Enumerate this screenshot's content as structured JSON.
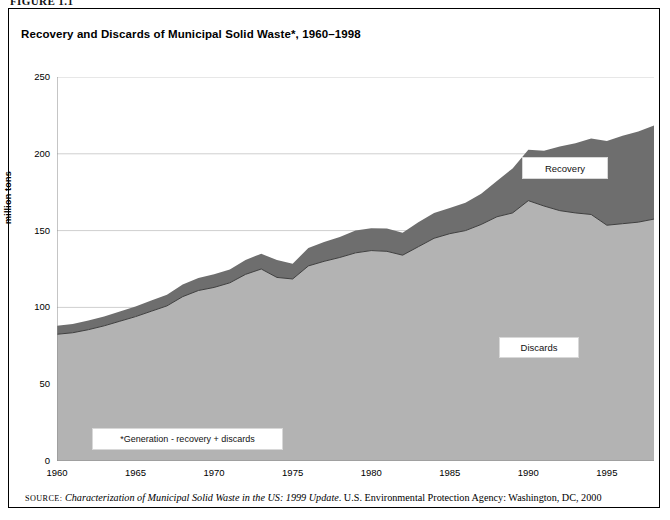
{
  "figure_label": "FIGURE 1.1",
  "chart_title": "Recovery and Discards of Municipal Solid Waste*, 1960–1998",
  "callouts": {
    "recovery": "Recovery",
    "discards": "Discards",
    "footnote": "*Generation - recovery + discards"
  },
  "source": {
    "keyword": "source:",
    "title": "Characterization of Municipal Solid Waste in the US: 1999 Update",
    "rest": ". U.S. Environmental Protection Agency: Washington, DC, 2000"
  },
  "colors": {
    "discards_fill": "#b3b3b3",
    "recovery_fill": "#6e6e6e",
    "axis": "#8c8c8c",
    "gridline": "#cfcfcf",
    "frame": "#000000"
  },
  "chart_data": {
    "type": "area",
    "stacked": true,
    "title": "Recovery and Discards of Municipal Solid Waste*, 1960–1998",
    "xlabel": "",
    "ylabel": "million tons",
    "xlim": [
      1960,
      1998
    ],
    "ylim": [
      0,
      250
    ],
    "yticks": [
      0,
      50,
      100,
      150,
      200,
      250
    ],
    "xticks": [
      1960,
      1965,
      1970,
      1975,
      1980,
      1985,
      1990,
      1995
    ],
    "grid": "horizontal",
    "legend_position": "in-plot-callouts",
    "x": [
      1960,
      1961,
      1962,
      1963,
      1964,
      1965,
      1966,
      1967,
      1968,
      1969,
      1970,
      1971,
      1972,
      1973,
      1974,
      1975,
      1976,
      1977,
      1978,
      1979,
      1980,
      1981,
      1982,
      1983,
      1984,
      1985,
      1986,
      1987,
      1988,
      1989,
      1990,
      1991,
      1992,
      1993,
      1994,
      1995,
      1996,
      1997,
      1998
    ],
    "series": [
      {
        "name": "Discards",
        "values": [
          82.5,
          83.5,
          85.5,
          88.0,
          91.0,
          94.0,
          97.5,
          101.0,
          107.0,
          111.0,
          113.0,
          116.0,
          121.5,
          125.0,
          119.5,
          118.5,
          127.0,
          130.0,
          132.5,
          135.5,
          137.0,
          136.5,
          134.0,
          139.5,
          145.0,
          148.0,
          150.0,
          154.0,
          159.0,
          161.5,
          169.5,
          166.0,
          163.0,
          161.5,
          160.5,
          153.5,
          154.5,
          155.5,
          157.5
        ]
      },
      {
        "name": "Recovery",
        "values": [
          5.6,
          5.7,
          5.9,
          6.1,
          6.4,
          6.6,
          7.0,
          7.3,
          7.9,
          8.2,
          8.6,
          8.6,
          9.4,
          9.9,
          11.3,
          9.9,
          11.7,
          12.5,
          13.4,
          14.6,
          14.5,
          14.9,
          14.6,
          16.0,
          16.4,
          16.7,
          18.2,
          20.0,
          23.3,
          29.0,
          33.2,
          36.0,
          41.7,
          45.3,
          49.5,
          54.9,
          57.3,
          59.0,
          61.0
        ]
      },
      {
        "name": "Generation (total)",
        "derived": true,
        "values": [
          88.1,
          89.2,
          91.4,
          94.1,
          97.4,
          100.6,
          104.5,
          108.3,
          114.9,
          119.2,
          121.6,
          124.6,
          130.9,
          134.9,
          130.8,
          128.4,
          138.7,
          142.5,
          145.9,
          150.1,
          151.5,
          151.4,
          148.6,
          155.5,
          161.4,
          164.7,
          168.2,
          174.0,
          182.3,
          190.5,
          202.7,
          202.0,
          204.7,
          206.8,
          210.0,
          208.4,
          211.8,
          214.5,
          218.5
        ]
      }
    ]
  }
}
